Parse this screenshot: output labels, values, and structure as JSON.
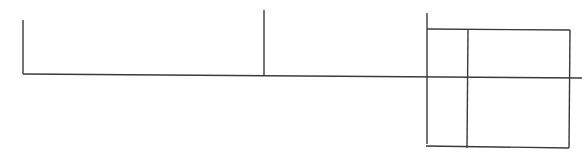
{
  "diagram": {
    "stroke_color": "#3a3a3a",
    "background": "#ffffff",
    "lines": [
      {
        "name": "left-vertical-line",
        "x1": 23,
        "y1": 20,
        "x2": 23,
        "y2": 74
      },
      {
        "name": "main-horizontal-line",
        "x1": 23,
        "y1": 74,
        "x2": 582,
        "y2": 78
      },
      {
        "name": "middle-vertical-line",
        "x1": 264,
        "y1": 10,
        "x2": 264,
        "y2": 76
      },
      {
        "name": "right-vertical-line",
        "x1": 427,
        "y1": 13,
        "x2": 427,
        "y2": 144
      },
      {
        "name": "box-top-line",
        "x1": 427,
        "y1": 29,
        "x2": 570,
        "y2": 30
      },
      {
        "name": "box-inner-vertical-line",
        "x1": 468,
        "y1": 29,
        "x2": 467,
        "y2": 148
      },
      {
        "name": "box-right-line",
        "x1": 570,
        "y1": 30,
        "x2": 569,
        "y2": 148
      },
      {
        "name": "box-bottom-line",
        "x1": 426,
        "y1": 146,
        "x2": 569,
        "y2": 148
      }
    ]
  }
}
